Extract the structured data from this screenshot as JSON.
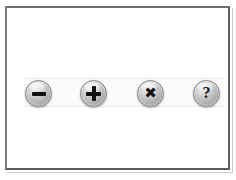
{
  "window": {
    "background_color": "#ffffff",
    "frame_color": "#6e6e6e"
  },
  "toolbar": {
    "name": "button-bar",
    "background_color": "#fbfbfa",
    "buttons": [
      {
        "id": "minus",
        "icon": "minus-icon",
        "label": "–",
        "tooltip": "Remove",
        "glyph_color": "#101010"
      },
      {
        "id": "plus",
        "icon": "plus-icon",
        "label": "+",
        "tooltip": "Add",
        "glyph_color": "#101010"
      },
      {
        "id": "close",
        "icon": "close-x-icon",
        "label": "✖",
        "tooltip": "Delete",
        "glyph_color": "#101010"
      },
      {
        "id": "help",
        "icon": "question-mark-icon",
        "label": "?",
        "tooltip": "Help",
        "glyph_color": "#101010"
      }
    ]
  }
}
